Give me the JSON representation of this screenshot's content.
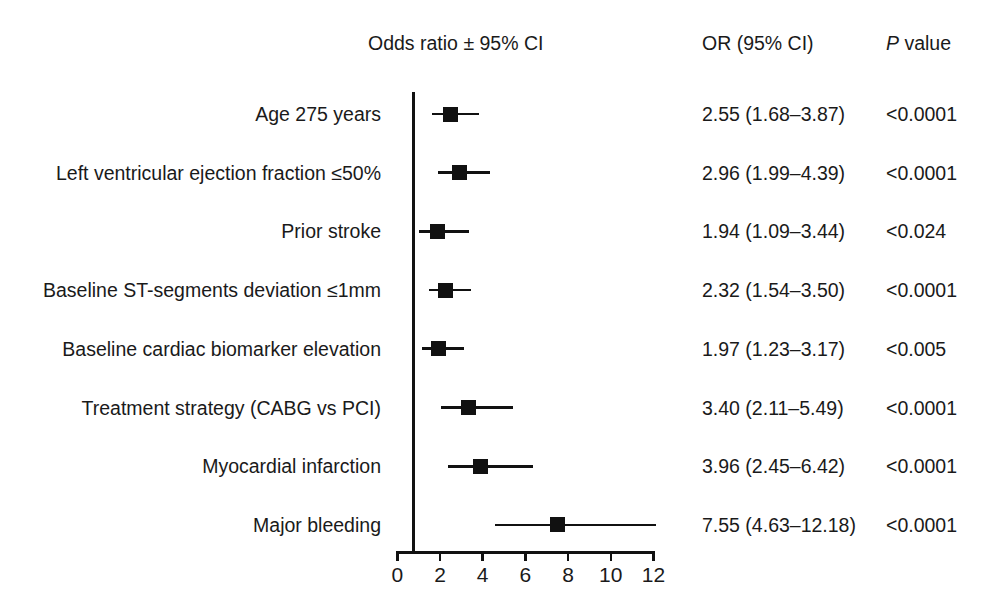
{
  "figure": {
    "type": "forest-plot",
    "background_color": "#ffffff",
    "ink_color": "#111111"
  },
  "headers": {
    "plot_column": "Odds ratio ± 95% CI",
    "or_column": "OR (95% CI)",
    "p_column_italic": "P",
    "p_column_rest": " value"
  },
  "axis": {
    "ticks": [
      0,
      2,
      4,
      6,
      8,
      10,
      12
    ],
    "tick_labels": [
      "0",
      "2",
      "4",
      "6",
      "8",
      "10",
      "12"
    ],
    "min": 0,
    "max": 12,
    "reference_value": 1,
    "x_label": "",
    "grid": false
  },
  "rows": [
    {
      "label": "Age 275 years",
      "or": 2.55,
      "ci_low": 1.68,
      "ci_high": 3.87,
      "or_text": "2.55 (1.68–3.87)",
      "p_text": "<0.0001"
    },
    {
      "label": "Left ventricular ejection fraction ≤50%",
      "or": 2.96,
      "ci_low": 1.99,
      "ci_high": 4.39,
      "or_text": "2.96 (1.99–4.39)",
      "p_text": "<0.0001"
    },
    {
      "label": "Prior stroke",
      "or": 1.94,
      "ci_low": 1.09,
      "ci_high": 3.44,
      "or_text": "1.94 (1.09–3.44)",
      "p_text": "<0.024"
    },
    {
      "label": "Baseline ST-segments deviation ≤1mm",
      "or": 2.32,
      "ci_low": 1.54,
      "ci_high": 3.5,
      "or_text": "2.32 (1.54–3.50)",
      "p_text": "<0.0001"
    },
    {
      "label": "Baseline cardiac biomarker elevation",
      "or": 1.97,
      "ci_low": 1.23,
      "ci_high": 3.17,
      "or_text": "1.97 (1.23–3.17)",
      "p_text": "<0.005"
    },
    {
      "label": "Treatment strategy (CABG vs PCI)",
      "or": 3.4,
      "ci_low": 2.11,
      "ci_high": 5.49,
      "or_text": "3.40 (2.11–5.49)",
      "p_text": "<0.0001"
    },
    {
      "label": "Myocardial infarction",
      "or": 3.96,
      "ci_low": 2.45,
      "ci_high": 6.42,
      "or_text": "3.96 (2.45–6.42)",
      "p_text": "<0.0001"
    },
    {
      "label": "Major bleeding",
      "or": 7.55,
      "ci_low": 4.63,
      "ci_high": 12.18,
      "or_text": "7.55 (4.63–12.18)",
      "p_text": "<0.0001"
    }
  ],
  "chart_data": {
    "type": "scatter",
    "title": "",
    "subtitle": "",
    "xlabel": "Odds ratio ± 95% CI",
    "ylabel": "",
    "xlim": [
      0,
      12
    ],
    "xticks": [
      0,
      2,
      4,
      6,
      8,
      10,
      12
    ],
    "grid": false,
    "legend": "none",
    "reference_line_x": 1,
    "categories": [
      "Age 275 years",
      "Left ventricular ejection fraction ≤50%",
      "Prior stroke",
      "Baseline ST-segments deviation ≤1mm",
      "Baseline cardiac biomarker elevation",
      "Treatment strategy (CABG vs PCI)",
      "Myocardial infarction",
      "Major bleeding"
    ],
    "values": [
      2.55,
      2.96,
      1.94,
      2.32,
      1.97,
      3.4,
      3.96,
      7.55
    ],
    "ci_low": [
      1.68,
      1.99,
      1.09,
      1.54,
      1.23,
      2.11,
      2.45,
      4.63
    ],
    "ci_high": [
      3.87,
      4.39,
      3.44,
      3.5,
      3.17,
      5.49,
      6.42,
      12.18
    ],
    "annotations": [
      "2.55 (1.68–3.87)  <0.0001",
      "2.96 (1.99–4.39)  <0.0001",
      "1.94 (1.09–3.44)  <0.024",
      "2.32 (1.54–3.50)  <0.0001",
      "1.97 (1.23–3.17)  <0.005",
      "3.40 (2.11–5.49)  <0.0001",
      "3.96 (2.45–6.42)  <0.0001",
      "7.55 (4.63–12.18)  <0.0001"
    ]
  },
  "layout": {
    "row_top_y": 114,
    "row_spacing": 58.7,
    "axis_x0_px": 396,
    "px_per_unit": 21.35,
    "label_col_right": 381
  }
}
